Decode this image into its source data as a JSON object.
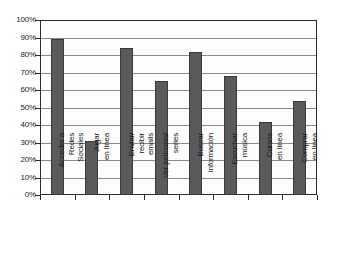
{
  "chart_data": {
    "type": "bar",
    "title": "",
    "subtitle": "",
    "xlabel": "",
    "ylabel": "",
    "ylim": [
      0,
      100
    ],
    "grid": true,
    "legend": "none",
    "value_suffix": "%",
    "categories": [
      "Acceder a Redes Sociales",
      "Jugar en línea",
      "Enviar/ recibir emails",
      "Ver películas/ series",
      "Buscar información",
      "Escuchar música",
      "Cursos en línea",
      "Comprar en línea"
    ],
    "category_lines": [
      [
        "Acceder a",
        "Redes",
        "Sociales"
      ],
      [
        "Jugar",
        "en línea"
      ],
      [
        "Enviar/",
        "recibir",
        "emails"
      ],
      [
        "Ver películas/",
        "series"
      ],
      [
        "Buscar",
        "información"
      ],
      [
        "Escuchar",
        "música"
      ],
      [
        "Cursos",
        "en línea"
      ],
      [
        "Comprar",
        "en línea"
      ]
    ],
    "values": [
      89,
      31,
      84,
      65,
      82,
      68,
      42,
      54
    ],
    "yticks": [
      0,
      10,
      20,
      30,
      40,
      50,
      60,
      70,
      80,
      90,
      100
    ],
    "ytick_labels": [
      "0%",
      "10%",
      "20%",
      "30%",
      "40%",
      "50%",
      "60%",
      "70%",
      "80%",
      "90%",
      "100%"
    ],
    "colors": {
      "bar_fill": "#5a5a5a",
      "bar_edge": "#3a3a3a",
      "grid": "#8a8a8a",
      "axis": "#2b2b2b",
      "background": "#ffffff",
      "plot_background": "#fdfdfd",
      "text": "#1a1a1a"
    }
  }
}
